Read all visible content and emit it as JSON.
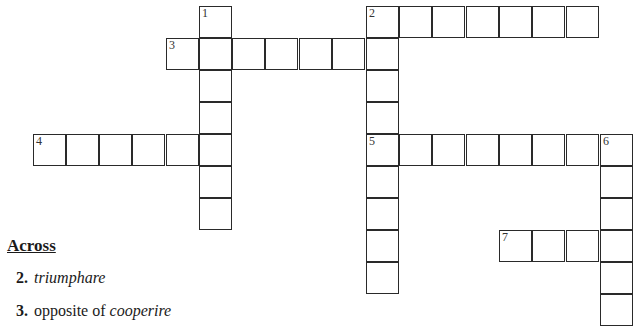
{
  "puzzle": {
    "cell_size": 33,
    "cells": [
      {
        "x": 199,
        "y": 6,
        "num": "1"
      },
      {
        "x": 199,
        "y": 38
      },
      {
        "x": 199,
        "y": 70
      },
      {
        "x": 199,
        "y": 102
      },
      {
        "x": 199,
        "y": 134
      },
      {
        "x": 199,
        "y": 166
      },
      {
        "x": 199,
        "y": 198
      },
      {
        "x": 166,
        "y": 38,
        "num": "3"
      },
      {
        "x": 232,
        "y": 38
      },
      {
        "x": 265,
        "y": 38
      },
      {
        "x": 299,
        "y": 38
      },
      {
        "x": 332,
        "y": 38
      },
      {
        "x": 366,
        "y": 6,
        "num": "2"
      },
      {
        "x": 399,
        "y": 6
      },
      {
        "x": 432,
        "y": 6
      },
      {
        "x": 466,
        "y": 6
      },
      {
        "x": 499,
        "y": 6
      },
      {
        "x": 532,
        "y": 6
      },
      {
        "x": 566,
        "y": 6
      },
      {
        "x": 366,
        "y": 38
      },
      {
        "x": 366,
        "y": 70
      },
      {
        "x": 366,
        "y": 102
      },
      {
        "x": 366,
        "y": 134,
        "num": "5"
      },
      {
        "x": 366,
        "y": 166
      },
      {
        "x": 366,
        "y": 198
      },
      {
        "x": 366,
        "y": 230
      },
      {
        "x": 366,
        "y": 262
      },
      {
        "x": 33,
        "y": 134,
        "num": "4"
      },
      {
        "x": 66,
        "y": 134
      },
      {
        "x": 99,
        "y": 134
      },
      {
        "x": 132,
        "y": 134
      },
      {
        "x": 166,
        "y": 134
      },
      {
        "x": 399,
        "y": 134
      },
      {
        "x": 432,
        "y": 134
      },
      {
        "x": 466,
        "y": 134
      },
      {
        "x": 499,
        "y": 134
      },
      {
        "x": 532,
        "y": 134
      },
      {
        "x": 566,
        "y": 134
      },
      {
        "x": 600,
        "y": 134,
        "num": "6"
      },
      {
        "x": 600,
        "y": 166
      },
      {
        "x": 600,
        "y": 198
      },
      {
        "x": 600,
        "y": 230
      },
      {
        "x": 600,
        "y": 262
      },
      {
        "x": 600,
        "y": 294
      },
      {
        "x": 499,
        "y": 230,
        "num": "7"
      },
      {
        "x": 532,
        "y": 230
      },
      {
        "x": 566,
        "y": 230
      }
    ]
  },
  "clues": {
    "across_heading": "Across",
    "across": [
      {
        "number": "2.",
        "parts": [
          {
            "text": "triumphare",
            "italic": true
          }
        ]
      },
      {
        "number": "3.",
        "parts": [
          {
            "text": "opposite of ",
            "italic": false
          },
          {
            "text": "cooperire",
            "italic": true
          }
        ]
      }
    ]
  }
}
